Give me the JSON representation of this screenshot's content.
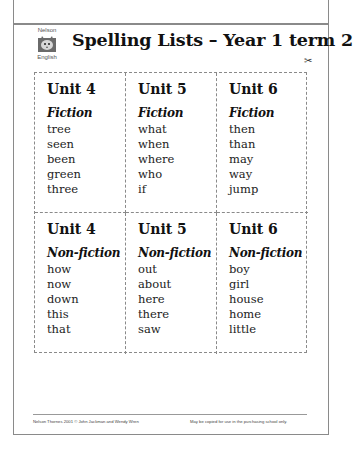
{
  "header": {
    "logo": {
      "top_text": "Nelson",
      "bottom_text": "English",
      "icon": "cat-icon"
    },
    "title": "Spelling Lists – Year 1 term 2",
    "cut_marker_icon": "scissors-icon",
    "cut_marker_glyph": "✂"
  },
  "grid": {
    "rows": [
      {
        "cells": [
          {
            "unit": "Unit 4",
            "genre": "Fiction",
            "words": [
              "tree",
              "seen",
              "been",
              "green",
              "three"
            ]
          },
          {
            "unit": "Unit 5",
            "genre": "Fiction",
            "words": [
              "what",
              "when",
              "where",
              "who",
              "if"
            ]
          },
          {
            "unit": "Unit 6",
            "genre": "Fiction",
            "words": [
              "then",
              "than",
              "may",
              "way",
              "jump"
            ]
          }
        ]
      },
      {
        "cells": [
          {
            "unit": "Unit 4",
            "genre": "Non-fiction",
            "words": [
              "how",
              "now",
              "down",
              "this",
              "that"
            ]
          },
          {
            "unit": "Unit 5",
            "genre": "Non-fiction",
            "words": [
              "out",
              "about",
              "here",
              "there",
              "saw"
            ]
          },
          {
            "unit": "Unit 6",
            "genre": "Non-fiction",
            "words": [
              "boy",
              "girl",
              "house",
              "home",
              "little"
            ]
          }
        ]
      }
    ]
  },
  "footer": {
    "copyright": "Nelson Thornes 2001 © John Jackman and Wendy Wren",
    "permission": "May be copied for use in the purchasing school only."
  }
}
